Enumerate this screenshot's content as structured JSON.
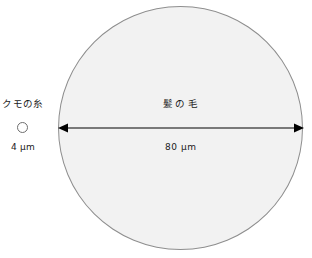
{
  "figure": {
    "title": "",
    "background_color": "#ffffff",
    "items": [
      {
        "id": "spider-silk",
        "name_label": "クモの糸",
        "size_label": "4 μm",
        "diameter_um": 4,
        "shape": "circle",
        "fill_color": "#ffffff",
        "stroke_color": "#6e6e6e"
      },
      {
        "id": "human-hair",
        "name_label": "髪の毛",
        "size_label": "80 μm",
        "diameter_um": 80,
        "shape": "circle",
        "fill_color": "#f2f2f2",
        "stroke_color": "#8e8e8e"
      }
    ],
    "dimension_arrow": {
      "icon": "double-headed-arrow",
      "color": "#000000",
      "measures": "human-hair",
      "value_label": "80 μm"
    }
  }
}
